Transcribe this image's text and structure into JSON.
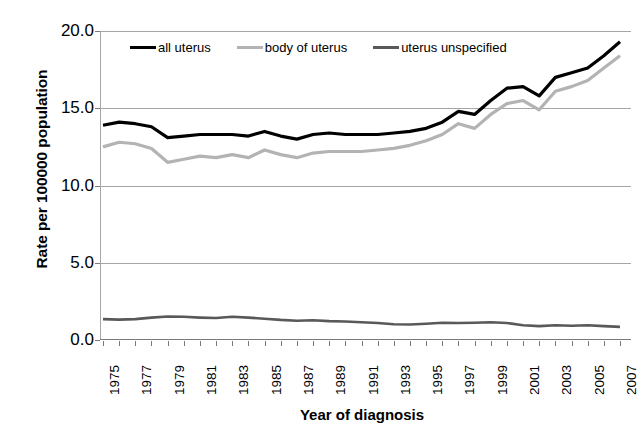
{
  "chart_data": {
    "type": "line",
    "title": "",
    "xlabel": "Year of diagnosis",
    "ylabel": "Rate per 100000 population",
    "xlim": [
      1975,
      2007
    ],
    "ylim": [
      0.0,
      20.0
    ],
    "yticks": [
      "0.0",
      "5.0",
      "10.0",
      "15.0",
      "20.0"
    ],
    "ytick_values": [
      0.0,
      5.0,
      10.0,
      15.0,
      20.0
    ],
    "grid": true,
    "legend_position": "top-center",
    "x": [
      1975,
      1976,
      1977,
      1978,
      1979,
      1980,
      1981,
      1982,
      1983,
      1984,
      1985,
      1986,
      1987,
      1988,
      1989,
      1990,
      1991,
      1992,
      1993,
      1994,
      1995,
      1996,
      1997,
      1998,
      1999,
      2000,
      2001,
      2002,
      2003,
      2004,
      2005,
      2006,
      2007
    ],
    "xtick_labels": [
      "1975",
      "1977",
      "1979",
      "1981",
      "1983",
      "1985",
      "1987",
      "1989",
      "1991",
      "1993",
      "1995",
      "1997",
      "1999",
      "2001",
      "2003",
      "2005",
      "2007"
    ],
    "series": [
      {
        "name": "all uterus",
        "color": "#000000",
        "width": 3.2,
        "values": [
          13.9,
          14.1,
          14.0,
          13.8,
          13.1,
          13.2,
          13.3,
          13.3,
          13.3,
          13.2,
          13.5,
          13.2,
          13.0,
          13.3,
          13.4,
          13.3,
          13.3,
          13.3,
          13.4,
          13.5,
          13.7,
          14.1,
          14.8,
          14.6,
          15.5,
          16.3,
          16.4,
          15.8,
          17.0,
          17.3,
          17.6,
          18.4,
          19.3
        ]
      },
      {
        "name": "body of uterus",
        "color": "#b3b3b3",
        "width": 3.2,
        "values": [
          12.5,
          12.8,
          12.7,
          12.4,
          11.5,
          11.7,
          11.9,
          11.8,
          12.0,
          11.8,
          12.3,
          12.0,
          11.8,
          12.1,
          12.2,
          12.2,
          12.2,
          12.3,
          12.4,
          12.6,
          12.9,
          13.3,
          14.0,
          13.7,
          14.6,
          15.3,
          15.5,
          14.9,
          16.1,
          16.4,
          16.8,
          17.6,
          18.4
        ]
      },
      {
        "name": "uterus unspecified",
        "color": "#595959",
        "width": 2.6,
        "values": [
          1.35,
          1.32,
          1.35,
          1.45,
          1.52,
          1.5,
          1.45,
          1.42,
          1.5,
          1.45,
          1.38,
          1.3,
          1.25,
          1.28,
          1.22,
          1.2,
          1.15,
          1.1,
          1.02,
          1.0,
          1.05,
          1.12,
          1.1,
          1.12,
          1.15,
          1.1,
          0.95,
          0.9,
          0.95,
          0.92,
          0.95,
          0.9,
          0.85
        ]
      }
    ]
  },
  "legend": {
    "items": [
      {
        "label": "all uterus"
      },
      {
        "label": "body of uterus"
      },
      {
        "label": "uterus unspecified"
      }
    ]
  },
  "caption": ""
}
